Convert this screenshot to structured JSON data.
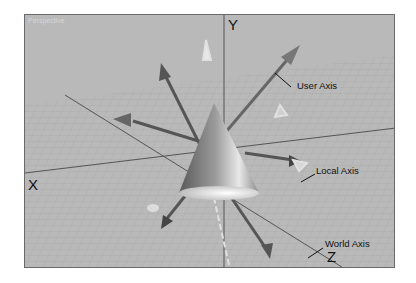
{
  "viewport": {
    "label": "Perspective",
    "background": "#b9b9b9",
    "border_color": "#6a6a6a"
  },
  "axes": {
    "x_label": "X",
    "y_label": "Y",
    "z_label": "Z"
  },
  "callouts": {
    "user_axis": "User Axis",
    "local_axis": "Local Axis",
    "world_axis": "World Axis"
  },
  "object": {
    "shape": "cone"
  }
}
